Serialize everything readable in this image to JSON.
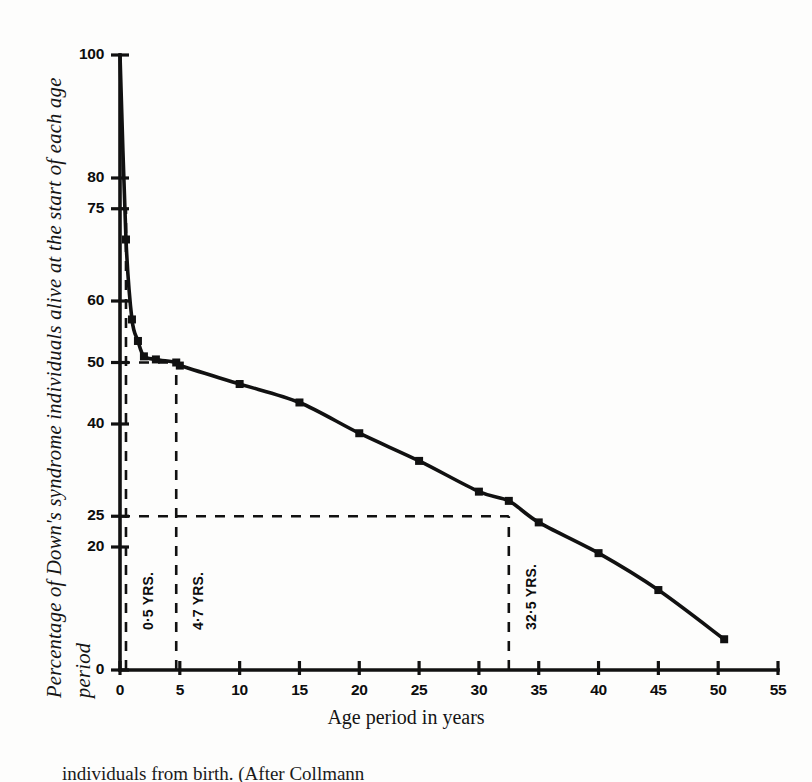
{
  "figure": {
    "y_axis_title": "Percentage of Down's syndrome individuals alive at the start of each age\nperiod",
    "x_axis_title": "Age period in years",
    "caption": "individuals from birth. (After Collmann"
  },
  "chart_data": {
    "type": "line",
    "title": "",
    "xlabel": "Age period in years",
    "ylabel": "Percentage of Down's syndrome individuals alive at the start of each age period",
    "xlim": [
      0,
      55
    ],
    "ylim": [
      0,
      100
    ],
    "grid": false,
    "legend": "none",
    "xticks": [
      0,
      5,
      10,
      15,
      20,
      25,
      30,
      35,
      40,
      45,
      50,
      55
    ],
    "xtick_labels": [
      "0",
      "5",
      "10",
      "15",
      "20",
      "25",
      "30",
      "35",
      "40",
      "45",
      "50",
      "55"
    ],
    "yticks": [
      0,
      20,
      25,
      40,
      50,
      60,
      75,
      80,
      100
    ],
    "ytick_labels": [
      "0",
      "20",
      "25",
      "40",
      "50",
      "60",
      "75",
      "80",
      "100"
    ],
    "series": [
      {
        "name": "Survivors",
        "marker": "filled-square",
        "x": [
          0,
          0.5,
          1,
          1.5,
          2,
          3,
          4.7,
          5,
          10,
          15,
          20,
          25,
          30,
          32.5,
          35,
          40,
          45,
          50.5
        ],
        "values": [
          100,
          70,
          57,
          53.5,
          51,
          50.5,
          50,
          49.5,
          46.5,
          43.5,
          38.5,
          34,
          29,
          27.5,
          24,
          19,
          13,
          5
        ]
      }
    ],
    "annotations": [
      {
        "name": "median-0-5-years",
        "label": "0·5 YRS.",
        "guide": "vertical",
        "x": 0.5,
        "y_from": 0,
        "y_to": 75
      },
      {
        "name": "median-4-7-years",
        "label": "4·7 YRS.",
        "guide": "vertical",
        "x": 4.7,
        "y_from": 0,
        "y_to": 50
      },
      {
        "name": "median-32-5-years",
        "label": "32·5 YRS.",
        "guide": "vertical",
        "x": 32.5,
        "y_from": 0,
        "y_to": 25
      },
      {
        "name": "guide-50-percent",
        "label": "",
        "guide": "horizontal",
        "y": 50,
        "x_from": 0,
        "x_to": 4.7
      },
      {
        "name": "guide-25-percent",
        "label": "",
        "guide": "horizontal",
        "y": 25,
        "x_from": 0,
        "x_to": 32.5
      },
      {
        "name": "guide-75-percent",
        "label": "",
        "guide": "horizontal",
        "y": 75,
        "x_from": 0,
        "x_to": 0.5
      }
    ],
    "colors": {
      "line": "#111111",
      "axis": "#111111",
      "guide": "#111111",
      "background": "#fdfdfc"
    }
  }
}
